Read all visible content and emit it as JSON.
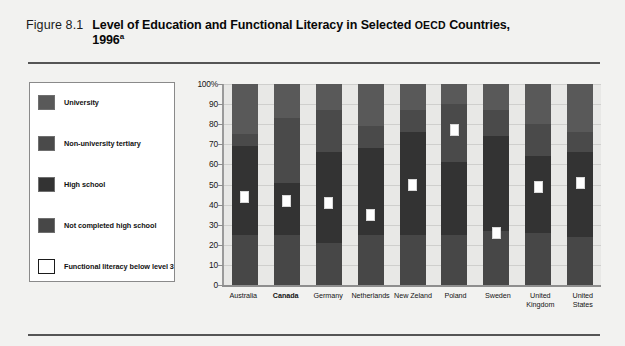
{
  "figure": {
    "number": "Figure 8.1",
    "title_part1": "Level of Education and Functional Literacy in Selected ",
    "title_smallcaps": "OECD",
    "title_part2": " Countries,",
    "title_line2": "1996",
    "title_superscript": "a"
  },
  "legend": {
    "items": [
      {
        "label": "University",
        "color": "#595959",
        "filled": true
      },
      {
        "label": "Non-university tertiary",
        "color": "#4a4a4a",
        "filled": true
      },
      {
        "label": "High school",
        "color": "#333333",
        "filled": true
      },
      {
        "label": "Not completed high school",
        "color": "#474747",
        "filled": true
      },
      {
        "label": "Functional literacy below level 3",
        "color": "#ffffff",
        "filled": false
      }
    ]
  },
  "chart_data": {
    "type": "bar",
    "subtype": "stacked-bar-with-marker",
    "xlabel": "",
    "ylabel": "",
    "ylim": [
      0,
      100
    ],
    "grid": true,
    "legend_position": "left",
    "ytick_labels": [
      "100%",
      "90",
      "80",
      "70",
      "60",
      "50",
      "40",
      "30",
      "20",
      "10",
      "0"
    ],
    "ytick_values": [
      100,
      90,
      80,
      70,
      60,
      50,
      40,
      30,
      20,
      10,
      0
    ],
    "categories": [
      "Australia",
      "Canada",
      "Germany",
      "Netherlands",
      "New Zeland",
      "Poland",
      "Sweden",
      "United Kingdom",
      "United States"
    ],
    "highlighted_category": "Canada",
    "series": [
      {
        "name": "University",
        "values": [
          25,
          17,
          13,
          21,
          13,
          10,
          13,
          20,
          24
        ]
      },
      {
        "name": "Non-university tertiary",
        "values": [
          6,
          32,
          21,
          11,
          11,
          29,
          13,
          16,
          10
        ]
      },
      {
        "name": "High school",
        "values": [
          44,
          26,
          45,
          43,
          51,
          36,
          47,
          38,
          42
        ]
      },
      {
        "name": "Not completed high school",
        "values": [
          25,
          25,
          21,
          25,
          25,
          25,
          27,
          26,
          24
        ]
      }
    ],
    "marker_series": {
      "name": "Functional literacy below level 3",
      "values": [
        44,
        42,
        41,
        35,
        50,
        77,
        26,
        49,
        51
      ]
    },
    "colors": {
      "university": "#595959",
      "non_university_tertiary": "#4a4a4a",
      "high_school": "#333333",
      "not_completed_high_school": "#474747",
      "plot_background": "#e8e8e6",
      "marker_fill": "#ffffff",
      "gridline": "#cfcfcd",
      "axis": "#8e8e8e"
    }
  }
}
